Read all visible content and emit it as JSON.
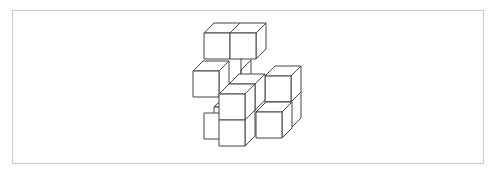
{
  "figure": {
    "type": "isometric-cube-stack",
    "stroke_color": "#444444",
    "border_color": "#c8c8c8",
    "background": "#ffffff",
    "cube_count_visible": 9
  }
}
